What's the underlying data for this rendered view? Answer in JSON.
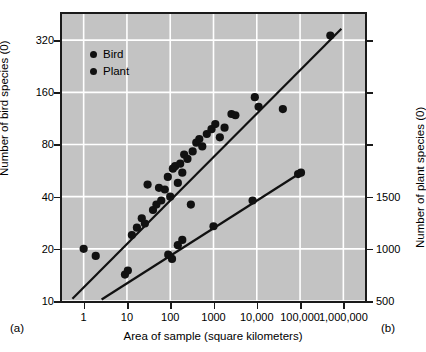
{
  "figure": {
    "panel_a_letter": "(a)",
    "panel_b_letter": "(b)"
  },
  "legend": {
    "items": [
      {
        "label": "Bird",
        "color": "#111111"
      },
      {
        "label": "Plant",
        "color": "#111111"
      }
    ]
  },
  "chart_data": {
    "type": "scatter",
    "title": "",
    "xlabel": "Area of sample (square kilometers)",
    "ylabel": "Number of bird species (0)",
    "y2label": "Number of plant species (0)",
    "xscale": "log",
    "yscale": "log",
    "xlim": [
      0.316,
      3162277
    ],
    "ylim": [
      10,
      453
    ],
    "grid": true,
    "legend_position": "top-left-inside",
    "xticks": [
      1,
      10,
      100,
      1000,
      10000,
      100000,
      1000000
    ],
    "xticklabels": [
      "1",
      "10",
      "100",
      "1000",
      "10,000",
      "100,000",
      "1,000,000"
    ],
    "yticks": [
      10,
      20,
      40,
      80,
      160,
      320
    ],
    "yticklabels": [
      "10",
      "20",
      "40",
      "80",
      "160",
      "320"
    ],
    "y2ticks": [
      500,
      1000,
      1500
    ],
    "y2ticklabels": [
      "500",
      "1000",
      "1500"
    ],
    "y2_unlabeled_ticks": 2,
    "series": [
      {
        "name": "Bird",
        "marker": "filled-circle",
        "color": "#111111",
        "points": [
          [
            1.0,
            20.0
          ],
          [
            1.9,
            18.2
          ],
          [
            9.0,
            14.2
          ],
          [
            10.5,
            15.0
          ],
          [
            13.0,
            24.0
          ],
          [
            17.0,
            26.5
          ],
          [
            22.0,
            30.0
          ],
          [
            26.0,
            28.0
          ],
          [
            30.0,
            47.0
          ],
          [
            40.0,
            33.5
          ],
          [
            48.0,
            36.0
          ],
          [
            55.0,
            45.0
          ],
          [
            62.0,
            38.0
          ],
          [
            75.0,
            44.0
          ],
          [
            88.0,
            52.0
          ],
          [
            100.0,
            40.0
          ],
          [
            115.0,
            58.0
          ],
          [
            130.0,
            60.0
          ],
          [
            150.0,
            48.0
          ],
          [
            170.0,
            62.0
          ],
          [
            190.0,
            55.0
          ],
          [
            210.0,
            70.0
          ],
          [
            250.0,
            66.0
          ],
          [
            300.0,
            36.0
          ],
          [
            330.0,
            73.0
          ],
          [
            400.0,
            82.0
          ],
          [
            470.0,
            86.0
          ],
          [
            550.0,
            78.0
          ],
          [
            700.0,
            92.0
          ],
          [
            900.0,
            98.0
          ],
          [
            1100.0,
            105.0
          ],
          [
            1400.0,
            88.0
          ],
          [
            1800.0,
            100.0
          ],
          [
            2600.0,
            120.0
          ],
          [
            3200.0,
            118.0
          ],
          [
            9000.0,
            150.0
          ],
          [
            11000.0,
            132.0
          ],
          [
            40000.0,
            128.0
          ],
          [
            500000.0,
            340.0
          ]
        ]
      },
      {
        "name": "Plant",
        "marker": "filled-circle",
        "color": "#111111",
        "points": [
          [
            90.0,
            18.5
          ],
          [
            110.0,
            17.5
          ],
          [
            150.0,
            21.0
          ],
          [
            190.0,
            22.5
          ],
          [
            1000.0,
            27.0
          ],
          [
            8000.0,
            38.0
          ],
          [
            90000.0,
            54.0
          ],
          [
            105000.0,
            55.0
          ]
        ]
      }
    ],
    "trend_lines": [
      {
        "name": "Bird regression",
        "x": [
          0.55,
          900000.0
        ],
        "y": [
          10.3,
          372.0
        ]
      },
      {
        "name": "Plant regression",
        "x": [
          2.6,
          110000.0
        ],
        "y": [
          10.2,
          55.5
        ]
      }
    ]
  }
}
